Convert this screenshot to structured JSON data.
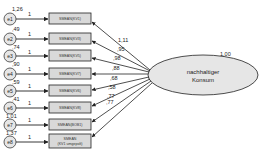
{
  "latent": {
    "label_line1": "nachhaltiger",
    "label_line2": "Konsum",
    "variance": "1,00"
  },
  "indicators": [
    {
      "error": "e1",
      "error_var": "1,26",
      "path": "1",
      "label": "SMEAN(KV1)",
      "loading": "1,11"
    },
    {
      "error": "e2",
      "error_var": ",49",
      "path": "1",
      "label": "SMEAN(KV3)",
      "loading": ",95"
    },
    {
      "error": "e3",
      "error_var": ",74",
      "path": "1",
      "label": "SMEAN(KV5)",
      "loading": ",98"
    },
    {
      "error": "e4",
      "error_var": ",90",
      "path": "1",
      "label": "SMEAN(KV7)",
      "loading": ",88"
    },
    {
      "error": "e5",
      "error_var": ",59",
      "path": "1",
      "label": "SMEAN(KV6)",
      "loading": ",68"
    },
    {
      "error": "e6",
      "error_var": ",41",
      "path": "1",
      "label": "SMEAN(KV8)",
      "loading": ",58"
    },
    {
      "error": "e7",
      "error_var": "1,01",
      "path": "1",
      "label": "SMEAN(BOB1)",
      "loading": ",77"
    },
    {
      "error": "e8",
      "error_var": "1,37",
      "path": "1",
      "label": "SMEAN",
      "label2": "(KV1 umgepolt)",
      "loading": ",77"
    }
  ],
  "colors": {
    "box_fill": "#d9d9d9",
    "ellipse_fill": "#e6e6e6",
    "stroke": "#222222"
  }
}
